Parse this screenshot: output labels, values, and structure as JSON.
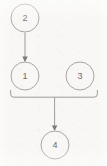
{
  "diagram": {
    "type": "directed-graph",
    "canvas": {
      "width": 107,
      "height": 166
    },
    "background_color": "#f8f7f5",
    "stroke_color": "#9e9b96",
    "node_stroke_color": "#a9a6a1",
    "label_color": "#6f6c68",
    "node_radius": 14,
    "nodes": [
      {
        "id": "2",
        "label": "2",
        "cx": 25,
        "cy": 18
      },
      {
        "id": "1",
        "label": "1",
        "cx": 25,
        "cy": 76
      },
      {
        "id": "3",
        "label": "3",
        "cx": 80,
        "cy": 76
      },
      {
        "id": "4",
        "label": "4",
        "cx": 55,
        "cy": 145
      }
    ],
    "edges": [
      {
        "id": "e-2-1",
        "from": "2",
        "to": "1",
        "style": "arrow",
        "shape": "vertical"
      },
      {
        "id": "e-1-3-join",
        "from": "1,3",
        "to": "join",
        "style": "bracket",
        "shape": "bracket"
      },
      {
        "id": "e-join-4",
        "from": "join",
        "to": "4",
        "style": "arrow",
        "shape": "vertical"
      }
    ]
  }
}
